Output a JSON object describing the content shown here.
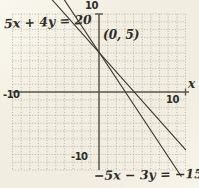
{
  "chart_data": {
    "type": "line",
    "title": "",
    "xlabel": "x",
    "ylabel": "",
    "xlim": [
      -10,
      10
    ],
    "ylim": [
      -10,
      10
    ],
    "grid": true,
    "grid_step": 1,
    "tick_labels": {
      "y_top": "10",
      "y_bottom": "-10",
      "x_left": "-10",
      "x_right": "10"
    },
    "series": [
      {
        "label": "5x + 4y = 20",
        "slope": -1.25,
        "y_intercept": 5,
        "x_intercept": 4,
        "endpoints": [
          [
            -5.4,
            11.8
          ],
          [
            10.0,
            -7.4
          ]
        ]
      },
      {
        "label": "−5x − 3y = −15",
        "slope": -1.6667,
        "y_intercept": 5,
        "x_intercept": 3,
        "endpoints": [
          [
            -4.0,
            11.8
          ],
          [
            9.5,
            -10.8
          ]
        ]
      }
    ],
    "annotations": [
      {
        "text": "(0, 5)",
        "x": 0,
        "y": 5
      }
    ]
  },
  "colors": {
    "paper": "#f2eee1",
    "grid": "#a5a196",
    "axis": "#5a574e",
    "line": "#3d3a34",
    "text": "#2f2d28"
  }
}
